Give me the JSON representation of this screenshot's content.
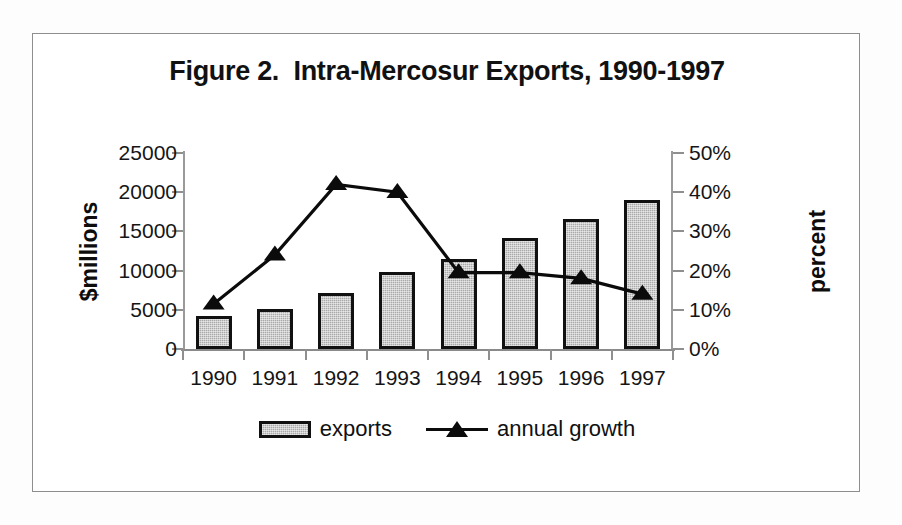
{
  "figure": {
    "title": "Figure 2.  Intra-Mercosur Exports, 1990-1997",
    "frame_border_color": "#8e8e8e",
    "background_color": "#ffffff"
  },
  "axes": {
    "left": {
      "label": "$millions",
      "ticks": [
        "0",
        "5000",
        "10000",
        "15000",
        "20000",
        "25000"
      ],
      "min": 0,
      "max": 25000,
      "step": 5000
    },
    "right": {
      "label": "percent",
      "ticks": [
        "0%",
        "10%",
        "20%",
        "30%",
        "40%",
        "50%"
      ],
      "min": 0,
      "max": 50,
      "step": 10
    },
    "x": {
      "label": "",
      "ticks": [
        "1990",
        "1991",
        "1992",
        "1993",
        "1994",
        "1995",
        "1996",
        "1997"
      ]
    }
  },
  "legend": {
    "position": "bottom-center",
    "entries": [
      {
        "label": "exports",
        "marker": "bar-swatch",
        "color": "#a9a9a9"
      },
      {
        "label": "annual growth",
        "marker": "triangle-line",
        "color": "#0b0b0b"
      }
    ]
  },
  "chart_data": {
    "type": "bar",
    "title": "Figure 2.  Intra-Mercosur Exports, 1990-1997",
    "xlabel": "",
    "ylabel": "$millions",
    "y2label": "percent",
    "categories": [
      "1990",
      "1991",
      "1992",
      "1993",
      "1994",
      "1995",
      "1996",
      "1997"
    ],
    "ylim": [
      0,
      25000
    ],
    "y2lim": [
      0,
      50
    ],
    "grid": false,
    "legend_position": "bottom-center",
    "series": [
      {
        "name": "exports",
        "type": "bar",
        "axis": "left",
        "unit": "$millions",
        "color": "#a9a9a9",
        "values": [
          4200,
          5100,
          7200,
          9800,
          11500,
          14100,
          16600,
          19000
        ]
      },
      {
        "name": "annual growth",
        "type": "line",
        "axis": "right",
        "unit": "percent",
        "color": "#0b0b0b",
        "marker": "triangle",
        "values": [
          11.5,
          24.0,
          42.0,
          40.0,
          19.5,
          19.5,
          18.0,
          14.0
        ]
      }
    ]
  }
}
